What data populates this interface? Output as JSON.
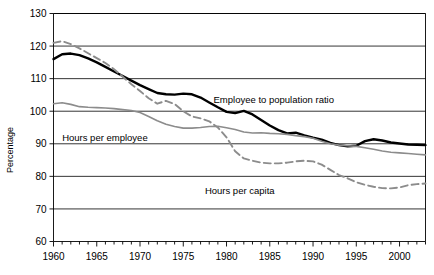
{
  "chart_data": {
    "type": "line",
    "title": "",
    "xlabel": "",
    "ylabel": "Percentage",
    "xlim": [
      1960,
      2003
    ],
    "ylim": [
      60,
      130
    ],
    "ytick_labels": [
      "130",
      "120",
      "110",
      "100",
      "90",
      "80",
      "70",
      "60"
    ],
    "yticks": [
      130,
      120,
      110,
      100,
      90,
      80,
      70,
      60
    ],
    "xtick_labels": [
      "1960",
      "1965",
      "1970",
      "1975",
      "1980",
      "1985",
      "1990",
      "1995",
      "2000"
    ],
    "xticks": [
      1960,
      1965,
      1970,
      1975,
      1980,
      1985,
      1990,
      1995,
      2000
    ],
    "minor_xtick_interval": 1,
    "grid": "horizontal",
    "legend_position": "inline-annotations",
    "annotations": [
      {
        "name": "employee-to-population-ratio-label",
        "text": "Employee to population ratio",
        "x": 1978.5,
        "y": 102.5
      },
      {
        "name": "hours-per-employee-label",
        "text": "Hours per employee",
        "x": 1961.0,
        "y": 91.0
      },
      {
        "name": "hours-per-capita-label",
        "text": "Hours per capita",
        "x": 1977.5,
        "y": 74.5
      }
    ],
    "x": [
      1960,
      1961,
      1962,
      1963,
      1964,
      1965,
      1966,
      1967,
      1968,
      1969,
      1970,
      1971,
      1972,
      1973,
      1974,
      1975,
      1976,
      1977,
      1978,
      1979,
      1980,
      1981,
      1982,
      1983,
      1984,
      1985,
      1986,
      1987,
      1988,
      1989,
      1990,
      1991,
      1992,
      1993,
      1994,
      1995,
      1996,
      1997,
      1998,
      1999,
      2000,
      2001,
      2002,
      2003
    ],
    "series": [
      {
        "name": "Hours per employee",
        "style": "solid-black-thick",
        "color": "#000000",
        "values": [
          116.0,
          117.5,
          117.7,
          117.2,
          116.2,
          115.0,
          113.6,
          112.2,
          110.8,
          109.4,
          108.0,
          106.8,
          105.6,
          105.2,
          105.1,
          105.4,
          105.2,
          104.2,
          102.7,
          101.2,
          99.8,
          99.4,
          100.1,
          99.0,
          97.3,
          95.6,
          94.2,
          93.2,
          93.4,
          92.6,
          91.9,
          91.3,
          90.3,
          89.6,
          89.2,
          89.4,
          90.8,
          91.4,
          91.0,
          90.4,
          90.1,
          89.8,
          89.7,
          89.6
        ]
      },
      {
        "name": "Employee to population ratio",
        "style": "solid-gray",
        "color": "#8c8c8c",
        "values": [
          102.3,
          102.6,
          102.1,
          101.4,
          101.2,
          101.1,
          101.0,
          100.8,
          100.5,
          100.2,
          99.6,
          98.4,
          97.1,
          96.0,
          95.3,
          94.8,
          94.8,
          95.0,
          95.3,
          95.4,
          94.9,
          94.4,
          93.6,
          93.3,
          93.4,
          93.2,
          93.1,
          92.9,
          92.5,
          92.2,
          91.7,
          90.8,
          90.0,
          89.6,
          89.4,
          89.2,
          88.8,
          88.3,
          87.8,
          87.4,
          87.2,
          87.0,
          86.8,
          86.6
        ]
      },
      {
        "name": "Hours per capita",
        "style": "dashed-gray",
        "color": "#8c8c8c",
        "values": [
          121.0,
          121.5,
          120.6,
          119.3,
          117.8,
          116.3,
          114.8,
          112.9,
          110.6,
          108.3,
          106.2,
          104.0,
          102.3,
          103.2,
          102.2,
          100.0,
          98.4,
          97.8,
          96.9,
          95.0,
          92.0,
          87.7,
          85.5,
          84.8,
          84.2,
          84.0,
          84.0,
          84.2,
          84.6,
          84.8,
          84.6,
          83.6,
          82.0,
          80.4,
          79.4,
          78.2,
          77.4,
          76.8,
          76.4,
          76.3,
          76.6,
          77.3,
          77.6,
          77.8
        ]
      }
    ]
  },
  "axis": {
    "y_axis_title": "Percentage"
  }
}
